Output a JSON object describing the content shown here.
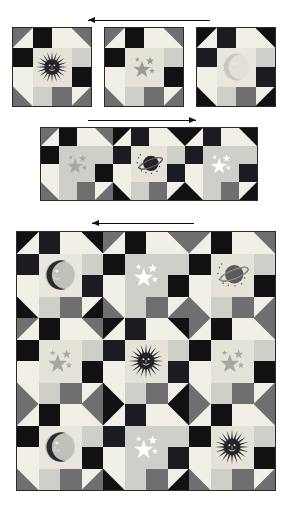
{
  "page": {
    "background": "#ffffff"
  },
  "palette": {
    "dark_navy": "#1b1b22",
    "black": "#111114",
    "medium_gray": "#6f6f72",
    "light_gray": "#cfcfc9",
    "pale_cream": "#e5e3d8",
    "off_white": "#f1efe6",
    "white": "#ffffff",
    "outline": "#2b2b2b",
    "motif_gray": "#9a9a96",
    "motif_dark": "#232329"
  },
  "arrows": [
    {
      "name": "row1-direction-arrow",
      "direction": "left",
      "label": "left arrow"
    },
    {
      "name": "row2-direction-arrow",
      "direction": "right",
      "label": "right arrow"
    },
    {
      "name": "row3-direction-arrow",
      "direction": "left",
      "label": "left arrow"
    }
  ],
  "rows": [
    {
      "name": "row-single-blocks",
      "caption": "Three separate blocks",
      "blocks": [
        {
          "motif": "sun-icon",
          "motif_label": "sun face",
          "scheme": "gray",
          "center_bg": "#e5e3d8",
          "motif_color": "#232329"
        },
        {
          "motif": "stars-icon",
          "motif_label": "stars",
          "scheme": "gray",
          "center_bg": "#e5e3d8",
          "motif_color": "#9a9a96"
        },
        {
          "motif": "moon-icon",
          "motif_label": "moon face",
          "scheme": "dark",
          "center_bg": "#e9e7dd",
          "motif_color": "#c9c7bd"
        }
      ]
    },
    {
      "name": "row-joined-blocks",
      "caption": "Three blocks joined in a strip",
      "blocks": [
        {
          "motif": "stars-icon",
          "motif_label": "stars",
          "scheme": "gray",
          "center_bg": "#cfcfc9",
          "motif_color": "#a8a8a2"
        },
        {
          "motif": "planet-icon",
          "motif_label": "planet",
          "scheme": "dark",
          "center_bg": "#e5e3d8",
          "motif_color": "#232329"
        },
        {
          "motif": "stars-icon",
          "motif_label": "white stars",
          "scheme": "dark",
          "center_bg": "#cfcfc9",
          "motif_color": "#ffffff"
        }
      ]
    },
    {
      "name": "row-full-quilt",
      "caption": "Nine blocks assembled into a full quilt",
      "blocks": [
        {
          "motif": "moon-icon",
          "motif_label": "moon face",
          "scheme": "dark",
          "center_bg": "#e9e7dd",
          "motif_color": "#2a2a30"
        },
        {
          "motif": "stars-icon",
          "motif_label": "white stars",
          "scheme": "gray",
          "center_bg": "#cfcfc9",
          "motif_color": "#ffffff"
        },
        {
          "motif": "planet-icon",
          "motif_label": "planet",
          "scheme": "gray",
          "center_bg": "#e5e3d8",
          "motif_color": "#5a5a5f"
        },
        {
          "motif": "stars-icon",
          "motif_label": "stars",
          "scheme": "gray",
          "center_bg": "#e5e3d8",
          "motif_color": "#a8a8a2"
        },
        {
          "motif": "sun-icon",
          "motif_label": "sun face",
          "scheme": "dark",
          "center_bg": "#e5e3d8",
          "motif_color": "#232329"
        },
        {
          "motif": "stars-icon",
          "motif_label": "stars",
          "scheme": "gray",
          "center_bg": "#e5e3d8",
          "motif_color": "#a8a8a2"
        },
        {
          "motif": "moon-icon",
          "motif_label": "moon face",
          "scheme": "gray",
          "center_bg": "#e9e7dd",
          "motif_color": "#2a2a30"
        },
        {
          "motif": "stars-icon",
          "motif_label": "white stars",
          "scheme": "dark",
          "center_bg": "#cfcfc9",
          "motif_color": "#ffffff"
        },
        {
          "motif": "sun-icon",
          "motif_label": "sun face",
          "scheme": "gray",
          "center_bg": "#e5e3d8",
          "motif_color": "#232329"
        }
      ]
    }
  ]
}
